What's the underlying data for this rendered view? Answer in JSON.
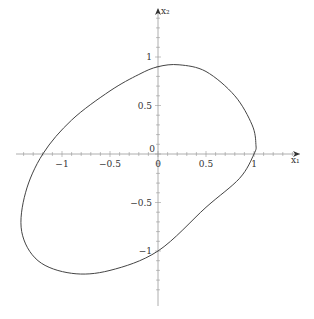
{
  "chart_data": {
    "type": "line",
    "title": "",
    "xlabel": "x1",
    "ylabel": "x2",
    "xlim": [
      -1.5,
      1.6
    ],
    "ylim": [
      -1.6,
      1.5
    ],
    "grid": false,
    "legend": null,
    "x_ticks": [
      -1,
      -0.5,
      0,
      0.5,
      1
    ],
    "y_ticks": [
      -1,
      -0.5,
      0,
      0.5,
      1
    ],
    "x_tick_labels": [
      "−1",
      "−0.5",
      "0",
      "0.5",
      "1"
    ],
    "y_tick_labels": [
      "−1",
      "−0.5",
      "0",
      "0.5",
      "1"
    ],
    "series": [
      {
        "name": "closed orbit",
        "closed": true,
        "x": [
          0.0,
          0.22,
          0.5,
          0.8,
          0.98,
          1.02,
          1.0,
          0.85,
          0.5,
          0.0,
          -0.5,
          -0.9,
          -1.25,
          -1.42,
          -1.38,
          -1.2,
          -0.9,
          -0.5,
          -0.2,
          0.0
        ],
        "y": [
          0.9,
          0.92,
          0.85,
          0.6,
          0.3,
          0.1,
          0.0,
          -0.25,
          -0.55,
          -1.0,
          -1.2,
          -1.23,
          -1.1,
          -0.8,
          -0.4,
          0.0,
          0.35,
          0.65,
          0.82,
          0.9
        ]
      }
    ]
  },
  "axes": {
    "x_axis_label": "x₁",
    "y_axis_label": "x₂",
    "origin_label": "0",
    "origin_label_below": "0"
  }
}
